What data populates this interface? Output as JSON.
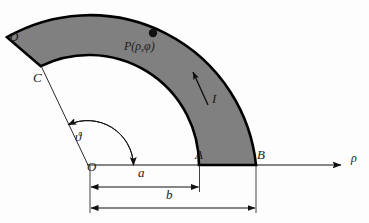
{
  "figure": {
    "colors": {
      "fill_gray": "#808080",
      "stroke_black": "#000000",
      "thin_line": "#1a1a1a",
      "background": "#fdfdfd"
    },
    "points": [
      {
        "name": "O",
        "label": "O",
        "x": 87,
        "y": 168,
        "role": "origin"
      },
      {
        "name": "A",
        "label": "A",
        "x": 198,
        "y": 156,
        "role": "inner-radius-on-axis"
      },
      {
        "name": "B",
        "label": "B",
        "x": 256,
        "y": 156,
        "role": "outer-radius-on-axis"
      },
      {
        "name": "C",
        "label": "C",
        "x": 33,
        "y": 79,
        "role": "inner-radius-end"
      },
      {
        "name": "D",
        "label": "D",
        "x": 9,
        "y": 37,
        "role": "outer-radius-end"
      }
    ],
    "field_point": {
      "label": "P(ρ,φ)",
      "dot_x": 153,
      "dot_y": 33,
      "label_x": 124,
      "label_y": 45
    },
    "current": {
      "label": "I",
      "description": "current direction arrow along the annulus",
      "arrow_from": [
        207,
        103
      ],
      "arrow_to": [
        193,
        74
      ],
      "label_x": 212,
      "label_y": 98
    },
    "angle": {
      "label": "ϑ",
      "label_x": 76,
      "label_y": 136,
      "description": "sector opening angle measured from the rho axis",
      "degrees": 116
    },
    "axis": {
      "label": "ρ",
      "label_x": 352,
      "label_y": 157,
      "from": [
        87,
        165
      ],
      "to": [
        345,
        165
      ]
    },
    "dimensions": [
      {
        "name": "a",
        "label": "a",
        "label_x": 138,
        "label_y": 171,
        "y": 187,
        "x_start": 90,
        "x_end": 199,
        "meaning": "inner radius"
      },
      {
        "name": "b",
        "label": "b",
        "label_x": 166,
        "label_y": 192,
        "y": 208,
        "x_start": 90,
        "x_end": 256,
        "meaning": "outer radius"
      }
    ],
    "geometry": {
      "center_x": 89,
      "center_y": 165,
      "inner_radius": 110,
      "outer_radius": 167,
      "start_angle_deg": 0,
      "end_angle_deg": 116
    }
  }
}
